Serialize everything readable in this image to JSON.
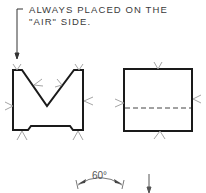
{
  "note": {
    "line1": "ALWAYS PLACED ON THE",
    "line2": "\"AIR\" SIDE."
  },
  "angle": {
    "label": "60°"
  },
  "colors": {
    "outline": "#1a1a1a",
    "symbol": "#9a9a9a",
    "dashed": "#444444"
  },
  "figures": [
    {
      "name": "v-block",
      "description": "V-shaped block with bottom relief and contact symbols"
    },
    {
      "name": "rectangular-block",
      "description": "Rectangular block with dashed hidden line and contact symbols"
    }
  ]
}
